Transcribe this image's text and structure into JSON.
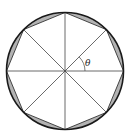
{
  "figure": {
    "angle_label": "θ",
    "sides": 8,
    "colors": {
      "circle_stroke": "#1a1a1a",
      "octagon_stroke": "#333333",
      "radius_stroke": "#444444",
      "segment_fill": "#b3b3b3",
      "background": "#ffffff"
    }
  }
}
